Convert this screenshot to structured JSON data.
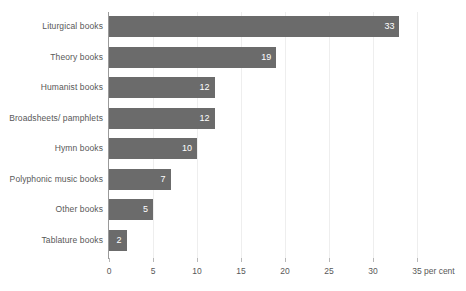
{
  "chart_data": {
    "type": "bar",
    "orientation": "horizontal",
    "title": "",
    "xlabel": "per cent",
    "ylabel": "",
    "categories": [
      "Liturgical books",
      "Theory books",
      "Humanist books",
      "Broadsheets/ pamphlets",
      "Hymn books",
      "Polyphonic music books",
      "Other books",
      "Tablature books"
    ],
    "values": [
      33,
      19,
      12,
      12,
      10,
      7,
      5,
      2
    ],
    "value_labels": [
      "33",
      "19",
      "12",
      "12",
      "10",
      "7",
      "5",
      "2"
    ],
    "xlim": [
      0,
      35
    ],
    "xticks": [
      0,
      5,
      10,
      15,
      20,
      25,
      30,
      35
    ],
    "xtick_labels": [
      "0",
      "5",
      "10",
      "15",
      "20",
      "25",
      "30",
      "35"
    ],
    "unit_label": "per cent",
    "grid": true,
    "grid_axis": "x",
    "legend": false,
    "bar_color": "#6b6b6b",
    "value_label_color": "#ffffff",
    "axis_text_color": "#585858",
    "gridline_color": "#eeeeee",
    "axis_line_color": "#9a9a9a",
    "background_color": "#ffffff"
  }
}
